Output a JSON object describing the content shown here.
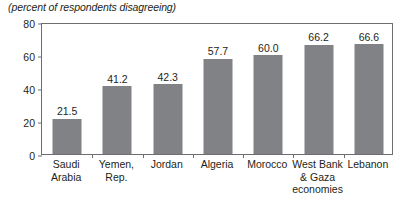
{
  "chart_data": {
    "type": "bar",
    "title": "",
    "subtitle": "(percent of respondents disagreeing)",
    "xlabel": "",
    "ylabel": "",
    "ylim": [
      0,
      80
    ],
    "yticks": [
      0,
      20,
      40,
      60,
      80
    ],
    "grid": false,
    "legend": null,
    "bar_color": "#808285",
    "axis_color": "#6d6e71",
    "text_color": "#231f20",
    "categories": [
      "Saudi Arabia",
      "Yemen, Rep.",
      "Jordan",
      "Algeria",
      "Morocco",
      "West Bank & Gaza economies",
      "Lebanon"
    ],
    "category_lines": [
      [
        "Saudi",
        "Arabia"
      ],
      [
        "Yemen,",
        "Rep."
      ],
      [
        "Jordan"
      ],
      [
        "Algeria"
      ],
      [
        "Morocco"
      ],
      [
        "West Bank",
        "& Gaza",
        "economies"
      ],
      [
        "Lebanon"
      ]
    ],
    "values": [
      21.5,
      41.2,
      42.3,
      57.7,
      60.0,
      66.2,
      66.6
    ],
    "value_labels": [
      "21.5",
      "41.2",
      "42.3",
      "57.7",
      "60.0",
      "66.2",
      "66.6"
    ]
  }
}
